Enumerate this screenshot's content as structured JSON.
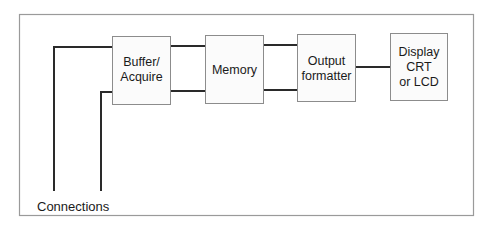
{
  "diagram": {
    "type": "block-diagram",
    "blocks": [
      {
        "id": "buffer",
        "lines": [
          "Buffer/",
          "Acquire"
        ]
      },
      {
        "id": "memory",
        "lines": [
          "Memory"
        ]
      },
      {
        "id": "output",
        "lines": [
          "Output",
          "formatter"
        ]
      },
      {
        "id": "display",
        "lines": [
          "Display",
          "CRT",
          "or LCD"
        ]
      }
    ],
    "connections_label": "Connections",
    "edges": [
      {
        "from": "connection-1",
        "to": "buffer"
      },
      {
        "from": "connection-2",
        "to": "buffer"
      },
      {
        "from": "buffer",
        "to": "memory",
        "count": 2
      },
      {
        "from": "memory",
        "to": "output",
        "count": 2
      },
      {
        "from": "output",
        "to": "display",
        "count": 1
      }
    ]
  }
}
